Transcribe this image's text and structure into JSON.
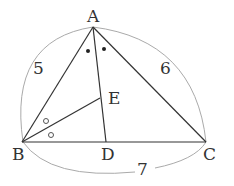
{
  "diagram": {
    "type": "triangle-geometry",
    "points": {
      "A": {
        "label": "A",
        "x": 93,
        "y": 27
      },
      "B": {
        "label": "B",
        "x": 22,
        "y": 142
      },
      "C": {
        "label": "C",
        "x": 206,
        "y": 142
      },
      "D": {
        "label": "D",
        "x": 106,
        "y": 142
      },
      "E": {
        "label": "E",
        "x": 100,
        "y": 98
      }
    },
    "segments": [
      "AB",
      "AC",
      "BC",
      "AD",
      "BE"
    ],
    "lengths": {
      "AB": "5",
      "AC": "6",
      "BC": "7"
    },
    "angle_marks": {
      "BAD_DAC": "filled-dot",
      "ABE_EBD": "open-circle"
    },
    "colors": {
      "line": "#333333",
      "arc": "#999999"
    }
  }
}
